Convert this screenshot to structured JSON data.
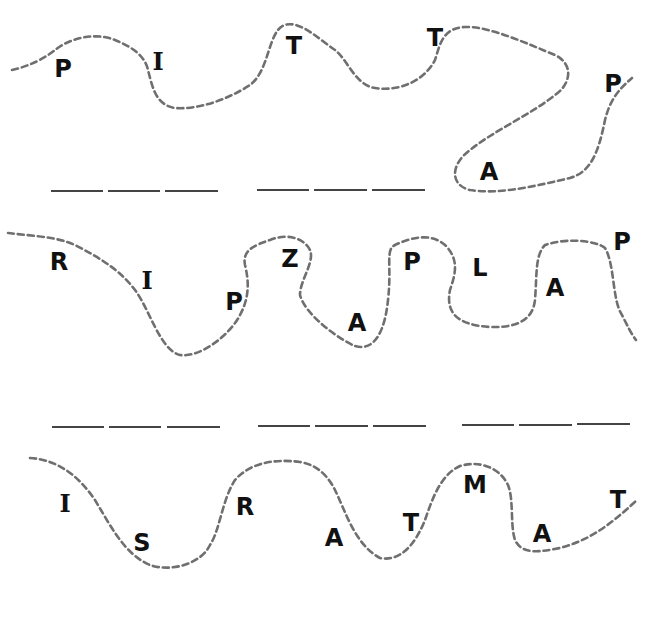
{
  "worksheet": {
    "header_text": "",
    "colors": {
      "path_stroke": "#6f6f6f",
      "letter": "#111111",
      "blank_line": "#444444",
      "background": "#ffffff"
    },
    "rows": [
      {
        "id": "row-1",
        "letters": [
          "P",
          "I",
          "T",
          "T",
          "A",
          "P"
        ],
        "answer_blank_groups": [
          3,
          3
        ]
      },
      {
        "id": "row-2",
        "letters": [
          "R",
          "I",
          "P",
          "Z",
          "A",
          "P",
          "L",
          "A",
          "P"
        ],
        "answer_blank_groups": [
          3,
          3,
          3
        ]
      },
      {
        "id": "row-3",
        "letters": [
          "I",
          "S",
          "R",
          "A",
          "T",
          "M",
          "A",
          "T"
        ],
        "answer_blank_groups": []
      }
    ]
  }
}
